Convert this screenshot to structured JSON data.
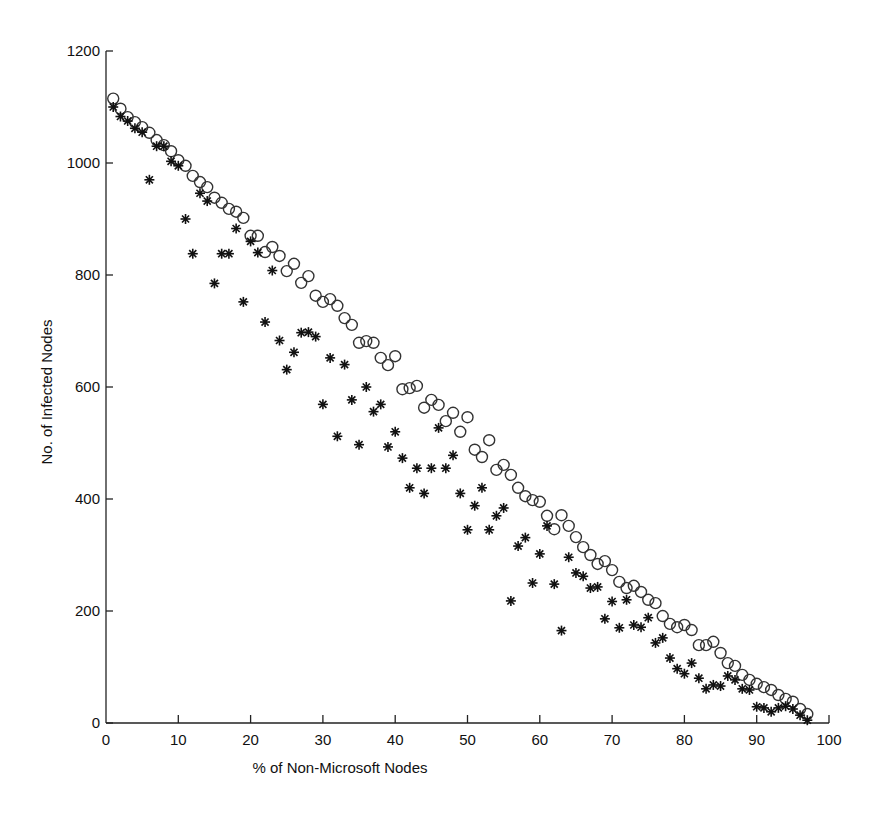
{
  "chart_data": {
    "type": "scatter",
    "title": "",
    "xlabel": "% of Non-Microsoft Nodes",
    "ylabel": "No. of Infected Nodes",
    "xlim": [
      0,
      100
    ],
    "ylim": [
      0,
      1200
    ],
    "x_ticks": [
      0,
      10,
      20,
      30,
      40,
      50,
      60,
      70,
      80,
      90,
      100
    ],
    "y_ticks": [
      0,
      200,
      400,
      600,
      800,
      1000,
      1200
    ],
    "grid": false,
    "legend": null,
    "series": [
      {
        "name": "circles",
        "marker": "circle-open",
        "x": [
          1,
          2,
          3,
          4,
          5,
          6,
          7,
          8,
          9,
          10,
          11,
          12,
          13,
          14,
          15,
          16,
          17,
          18,
          19,
          20,
          21,
          22,
          23,
          24,
          25,
          26,
          27,
          28,
          29,
          30,
          31,
          32,
          33,
          34,
          35,
          36,
          37,
          38,
          39,
          40,
          41,
          42,
          43,
          44,
          45,
          46,
          47,
          48,
          49,
          50,
          51,
          52,
          53,
          54,
          55,
          56,
          57,
          58,
          59,
          60,
          61,
          62,
          63,
          64,
          65,
          66,
          67,
          68,
          69,
          70,
          71,
          72,
          73,
          74,
          75,
          76,
          77,
          78,
          79,
          80,
          81,
          82,
          83,
          84,
          85,
          86,
          87,
          88,
          89,
          90,
          91,
          92,
          93,
          94,
          95,
          96,
          97
        ],
        "y": [
          1115,
          1097,
          1082,
          1073,
          1064,
          1054,
          1041,
          1032,
          1021,
          1005,
          995,
          977,
          966,
          957,
          938,
          929,
          918,
          913,
          902,
          870,
          870,
          841,
          850,
          834,
          807,
          820,
          786,
          798,
          763,
          752,
          757,
          745,
          723,
          711,
          679,
          682,
          679,
          652,
          639,
          655,
          596,
          598,
          602,
          563,
          577,
          568,
          539,
          554,
          520,
          546,
          488,
          475,
          505,
          452,
          461,
          443,
          420,
          405,
          398,
          395,
          370,
          346,
          371,
          352,
          332,
          314,
          300,
          284,
          289,
          273,
          252,
          241,
          245,
          234,
          220,
          214,
          191,
          177,
          171,
          175,
          166,
          139,
          139,
          145,
          125,
          107,
          102,
          86,
          77,
          70,
          64,
          59,
          50,
          43,
          38,
          25,
          16
        ]
      },
      {
        "name": "stars",
        "marker": "asterisk",
        "x": [
          1,
          2,
          3,
          4,
          5,
          6,
          7,
          8,
          9,
          10,
          11,
          12,
          13,
          14,
          15,
          16,
          17,
          18,
          19,
          20,
          21,
          22,
          23,
          24,
          25,
          26,
          27,
          28,
          29,
          30,
          31,
          32,
          33,
          34,
          35,
          36,
          37,
          38,
          39,
          40,
          41,
          42,
          43,
          44,
          45,
          46,
          47,
          48,
          49,
          50,
          51,
          52,
          53,
          54,
          55,
          56,
          57,
          58,
          59,
          60,
          61,
          62,
          63,
          64,
          65,
          66,
          67,
          68,
          69,
          70,
          71,
          72,
          73,
          74,
          75,
          76,
          77,
          78,
          79,
          80,
          81,
          82,
          83,
          84,
          85,
          86,
          87,
          88,
          89,
          90,
          91,
          92,
          93,
          94,
          95,
          96,
          97
        ],
        "y": [
          1100,
          1083,
          1075,
          1062,
          1055,
          970,
          1030,
          1030,
          1003,
          995,
          900,
          838,
          946,
          932,
          785,
          838,
          838,
          883,
          752,
          860,
          840,
          716,
          808,
          683,
          631,
          662,
          697,
          698,
          690,
          569,
          652,
          512,
          640,
          577,
          497,
          600,
          556,
          569,
          493,
          520,
          473,
          420,
          455,
          410,
          455,
          527,
          455,
          478,
          410,
          345,
          388,
          420,
          345,
          370,
          384,
          218,
          316,
          331,
          250,
          302,
          352,
          248,
          165,
          296,
          268,
          262,
          241,
          243,
          186,
          217,
          170,
          220,
          175,
          171,
          188,
          143,
          152,
          116,
          97,
          88,
          107,
          80,
          61,
          68,
          66,
          84,
          77,
          61,
          59,
          29,
          27,
          20,
          27,
          30,
          25,
          14,
          5
        ]
      }
    ]
  },
  "axes": {
    "x_title": "% of Non-Microsoft Nodes",
    "y_title": "No. of Infected Nodes"
  },
  "colors": {
    "marker": "#222222",
    "axis": "#222222",
    "background": "#ffffff"
  }
}
